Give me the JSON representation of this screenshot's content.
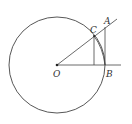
{
  "diagram": {
    "type": "geometry",
    "colors": {
      "stroke": "#444444",
      "background": "#ffffff"
    },
    "points": {
      "O": {
        "label": "O",
        "x": 57,
        "y": 65
      },
      "A": {
        "label": "A",
        "x": 105,
        "y": 27
      },
      "B": {
        "label": "B",
        "x": 105,
        "y": 65
      },
      "C": {
        "label": "C",
        "x": 94,
        "y": 36
      }
    },
    "circle": {
      "cx": 57,
      "cy": 65,
      "r": 48
    },
    "labels": {
      "O": "O",
      "A": "A",
      "B": "B",
      "C": "C"
    }
  }
}
